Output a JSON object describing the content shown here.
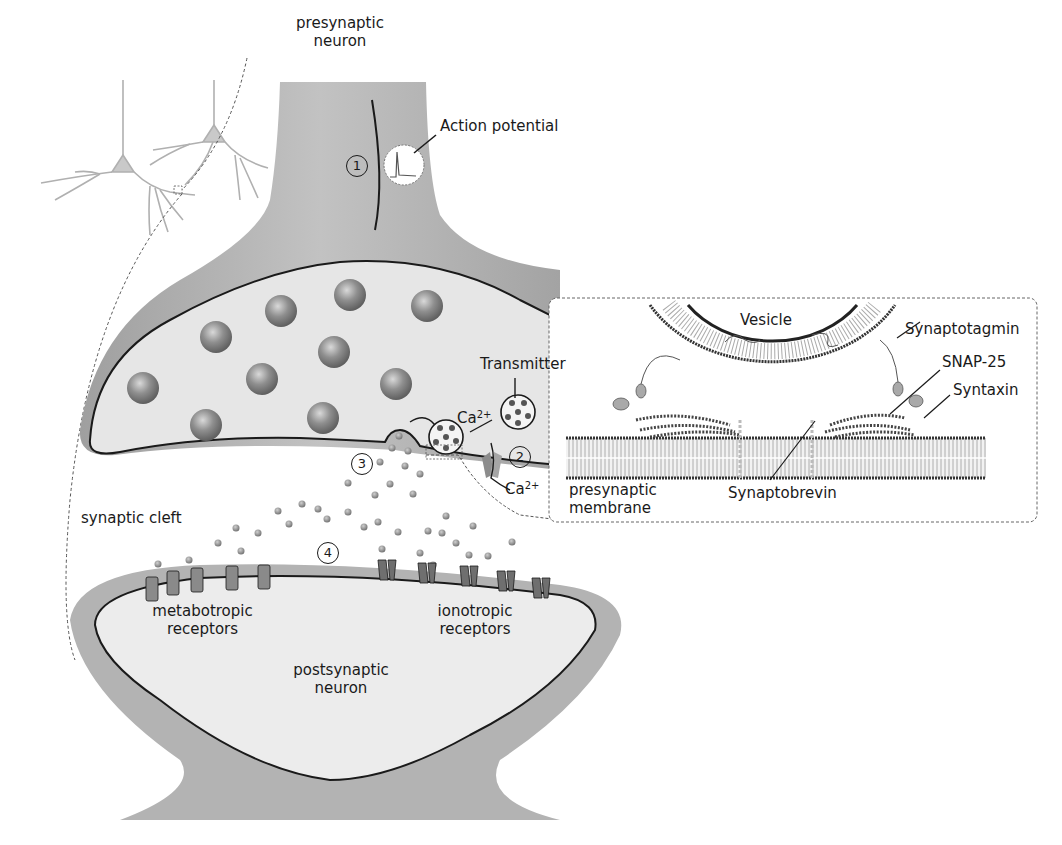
{
  "diagram": {
    "labels": {
      "presynaptic_neuron_line1": "presynaptic",
      "presynaptic_neuron_line2": "neuron",
      "action_potential": "Action potential",
      "transmitter": "Transmitter",
      "ca_upper": "Ca",
      "ca_upper_sup": "2+",
      "ca_lower": "Ca",
      "ca_lower_sup": "2+",
      "synaptic_cleft": "synaptic cleft",
      "metabotropic_line1": "metabotropic",
      "metabotropic_line2": "receptors",
      "ionotropic_line1": "ionotropic",
      "ionotropic_line2": "receptors",
      "postsynaptic_line1": "postsynaptic",
      "postsynaptic_line2": "neuron"
    },
    "steps": [
      "1",
      "2",
      "3",
      "4"
    ],
    "inset": {
      "vesicle": "Vesicle",
      "synaptotagmin": "Synaptotagmin",
      "snap25": "SNAP-25",
      "syntaxin": "Syntaxin",
      "synaptobrevin": "Synaptobrevin",
      "membrane_line1": "presynaptic",
      "membrane_line2": "membrane"
    },
    "colors": {
      "cell_outer": "#a9a9a9",
      "cell_inner": "#e4e4e4",
      "vesicle": "#8a8a8a",
      "outline": "#1a1a1a",
      "dashed": "#555555",
      "neuron_sketch": "#b5b5b5"
    }
  }
}
